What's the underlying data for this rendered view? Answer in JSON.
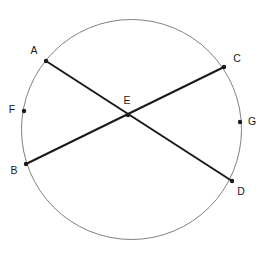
{
  "diagram": {
    "canvas": {
      "width": 274,
      "height": 256,
      "background": "#ffffff"
    },
    "colors": {
      "circle_stroke": "#808080",
      "chord_stroke": "#1a1a1a",
      "point_fill": "#1a1a1a",
      "label_fill": "#1a1a1a"
    },
    "circle": {
      "name": "circle",
      "cx": 131.5,
      "cy": 129.5,
      "r": 110,
      "stroke_width": 1
    },
    "chords": [
      {
        "name": "chord-AD",
        "from": "A",
        "to": "D",
        "stroke_width": 2
      },
      {
        "name": "chord-BC",
        "from": "B",
        "to": "C",
        "stroke_width": 2
      }
    ],
    "points": [
      {
        "id": "A",
        "label": "A",
        "x": 46,
        "y": 61,
        "lx": 34,
        "ly": 51,
        "marker": true,
        "on": "circle"
      },
      {
        "id": "C",
        "label": "C",
        "x": 224,
        "y": 67,
        "lx": 237,
        "ly": 59,
        "marker": true,
        "on": "circle"
      },
      {
        "id": "F",
        "label": "F",
        "x": 24,
        "y": 111,
        "lx": 12,
        "ly": 110,
        "marker": true,
        "on": "circle"
      },
      {
        "id": "E",
        "label": "E",
        "x": 128,
        "y": 115,
        "lx": 127,
        "ly": 101,
        "marker": true,
        "on": "intersection"
      },
      {
        "id": "G",
        "label": "G",
        "x": 240,
        "y": 122,
        "lx": 252,
        "ly": 122,
        "marker": true,
        "on": "circle"
      },
      {
        "id": "B",
        "label": "B",
        "x": 26,
        "y": 164,
        "lx": 14,
        "ly": 171,
        "marker": true,
        "on": "circle"
      },
      {
        "id": "D",
        "label": "D",
        "x": 232,
        "y": 181,
        "lx": 241,
        "ly": 192,
        "marker": true,
        "on": "circle"
      }
    ]
  }
}
